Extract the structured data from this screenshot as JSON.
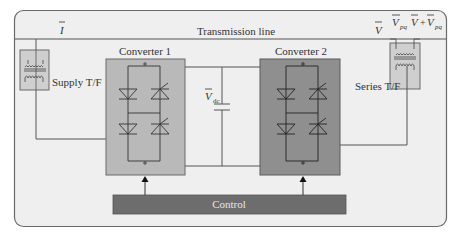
{
  "diagram": {
    "title_line": "Transmission line",
    "current_label": "I",
    "voltage_label": "V",
    "vpq_label": "V",
    "vpq_sub": "pq",
    "sum_label_v": "V",
    "sum_plus": "+",
    "sum_label_vpq": "V",
    "sum_sub": "pq",
    "supply_tf": "Supply T/F",
    "series_tf": "Series T/F",
    "converter1": "Converter 1",
    "converter2": "Converter 2",
    "vdc_label": "V",
    "vdc_sub": "dc",
    "control": "Control"
  },
  "colors": {
    "background": "#efefef",
    "border": "#6a6a6a",
    "converter1_fill": "#b9b9b9",
    "converter2_fill": "#8f8f8f",
    "control_fill": "#6d6d6d",
    "tf_fill": "#cfcfcf",
    "line": "#555555"
  }
}
